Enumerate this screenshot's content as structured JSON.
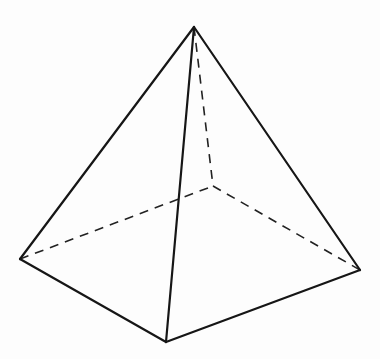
{
  "diagram": {
    "style": {
      "background": "#fdfdfd",
      "line_color": "#161616"
    },
    "vertices": {
      "apex": [
        194,
        27
      ],
      "left": [
        20,
        259
      ],
      "front": [
        166,
        342
      ],
      "right": [
        360,
        270
      ],
      "back": [
        213,
        186
      ]
    },
    "visible_edges": [
      [
        "apex",
        "left"
      ],
      [
        "apex",
        "front"
      ],
      [
        "apex",
        "right"
      ],
      [
        "left",
        "front"
      ],
      [
        "front",
        "right"
      ]
    ],
    "hidden_edges": [
      [
        "apex",
        "back"
      ],
      [
        "left",
        "back"
      ],
      [
        "back",
        "right"
      ]
    ]
  }
}
